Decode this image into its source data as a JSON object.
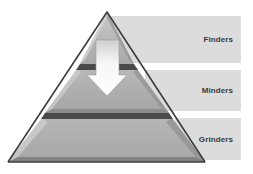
{
  "diagram": {
    "type": "pyramid",
    "levels": [
      {
        "label": "Finders",
        "position": "top"
      },
      {
        "label": "Minders",
        "position": "middle"
      },
      {
        "label": "Grinders",
        "position": "bottom"
      }
    ],
    "arrow": {
      "direction": "down",
      "from": "Finders",
      "to": "Minders"
    }
  },
  "colors": {
    "label_box": "#dcdcdc",
    "pyramid_fill": "#b4b4b4",
    "pyramid_outline": "#3c3c3c",
    "band": "#4a4a4a",
    "arrow_fill": "#f2f2f2",
    "label_text": "#3a3a3a"
  }
}
